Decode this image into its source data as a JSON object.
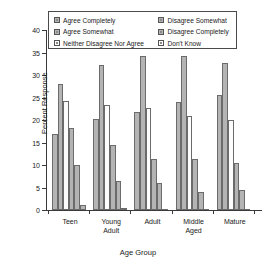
{
  "chart_data": {
    "type": "bar",
    "title": "",
    "xlabel": "Age Group",
    "ylabel": "Percent Response",
    "ylim": [
      0,
      40
    ],
    "yticks": [
      0,
      5,
      10,
      15,
      20,
      25,
      30,
      35,
      40
    ],
    "grid": false,
    "legend_position": "top-inside",
    "categories": [
      "Teen",
      "Young\nAdult",
      "Adult",
      "Middle\nAged",
      "Mature"
    ],
    "series": [
      {
        "name": "Agree Completely",
        "fill": "#b4b4b4",
        "values": [
          16.8,
          20.2,
          21.7,
          24.0,
          25.5
        ]
      },
      {
        "name": "Agree Somewhat",
        "fill": "#b4b4b4",
        "values": [
          28.0,
          32.3,
          34.2,
          34.2,
          32.7
        ]
      },
      {
        "name": "Neither Disagree Nor Agree",
        "fill": "#fdfdfd",
        "values": [
          24.3,
          23.3,
          22.6,
          21.0,
          19.9
        ]
      },
      {
        "name": "Disagree Somewhat",
        "fill": "#b4b4b4",
        "values": [
          18.3,
          14.4,
          11.4,
          11.3,
          10.4
        ]
      },
      {
        "name": "Disagree Completely",
        "fill": "#b4b4b4",
        "values": [
          10.0,
          6.5,
          5.9,
          4.0,
          4.5
        ]
      },
      {
        "name": "Don't Know",
        "fill": "#b4b4b4",
        "values": [
          1.2,
          0.5,
          0.0,
          0.0,
          0.0
        ]
      }
    ]
  },
  "legend": {
    "left_column": [
      "Agree Completely",
      "Agree Somewhat",
      "Neither Disagree Nor Agree"
    ],
    "right_column": [
      "Disagree Somewhat",
      "Disagree Completely",
      "Don't Know"
    ]
  }
}
